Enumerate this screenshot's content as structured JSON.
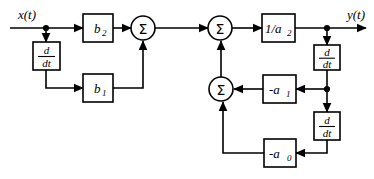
{
  "diagram": {
    "colors": {
      "line": "#000000",
      "background": "#ffffff",
      "box_fill": "#ffffff"
    },
    "io_labels": {
      "input": "x(t)",
      "output": "y(t)"
    },
    "summers": [
      {
        "id": "sigma-1",
        "label": "Σ"
      },
      {
        "id": "sigma-2",
        "label": "Σ"
      },
      {
        "id": "sigma-3",
        "label": "Σ"
      }
    ],
    "derivative_blocks": [
      {
        "id": "derivative-input",
        "numerator": "d",
        "denominator": "dt"
      },
      {
        "id": "derivative-output-1",
        "numerator": "d",
        "denominator": "dt"
      },
      {
        "id": "derivative-output-2",
        "numerator": "d",
        "denominator": "dt"
      }
    ],
    "gain_blocks": [
      {
        "id": "gain-b2",
        "base": "b",
        "sub": "2",
        "full": "b2"
      },
      {
        "id": "gain-b1",
        "base": "b",
        "sub": "1",
        "full": "b1"
      },
      {
        "id": "gain-inv-a2",
        "base": "1/a",
        "sub": "2",
        "full": "1/a2"
      },
      {
        "id": "gain-neg-a1",
        "base": "-a",
        "sub": "1",
        "full": "-a1"
      },
      {
        "id": "gain-neg-a0",
        "base": "-a",
        "sub": "0",
        "full": "-a0"
      }
    ]
  }
}
